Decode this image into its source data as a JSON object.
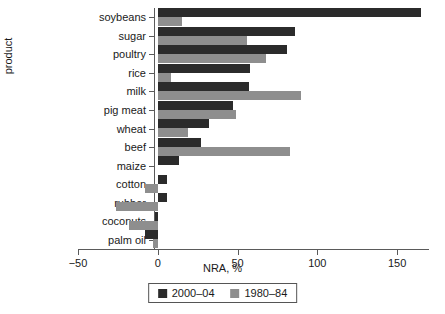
{
  "chart_data": {
    "type": "bar",
    "orientation": "horizontal",
    "title": "",
    "xlabel": "NRA, %",
    "ylabel": "product",
    "xlim": [
      -50,
      170
    ],
    "xticks": [
      -50,
      0,
      50,
      100,
      150
    ],
    "xticklabels": [
      "−50",
      "0",
      "50",
      "100",
      "150"
    ],
    "grid": false,
    "legend_position": "bottom-center",
    "categories": [
      "soybeans",
      "sugar",
      "poultry",
      "rice",
      "milk",
      "pig meat",
      "wheat",
      "beef",
      "maize",
      "cotton",
      "rubber",
      "coconuts",
      "palm oil"
    ],
    "series": [
      {
        "name": "2000–04",
        "color": "#2b2b2b",
        "values": [
          165,
          86,
          81,
          58,
          57,
          47,
          32,
          27,
          13,
          6,
          6,
          -2,
          -8
        ]
      },
      {
        "name": "1980–84",
        "color": "#8e8e8e",
        "values": [
          15,
          56,
          68,
          8,
          90,
          49,
          19,
          83,
          0,
          -8,
          -26,
          -18,
          -3
        ]
      }
    ]
  },
  "legend": {
    "items": [
      {
        "label": "2000–04",
        "swatch": "recent"
      },
      {
        "label": "1980–84",
        "swatch": "older"
      }
    ]
  }
}
